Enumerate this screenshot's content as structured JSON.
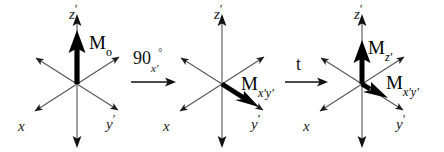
{
  "figure": {
    "stroke_color": "#1a1a1a",
    "vector_color": "#000000",
    "background": "#ffffff",
    "width": 444,
    "height": 152
  },
  "panels": [
    {
      "id": "panel-initial",
      "center": {
        "x": 77,
        "y": 84
      },
      "axes": [
        {
          "name": "z-prime",
          "label": "z",
          "prime": "′",
          "label_pos": {
            "x": 69,
            "y": 2
          }
        },
        {
          "name": "x-axis",
          "label": "x",
          "prime": "",
          "label_pos": {
            "x": 18,
            "y": 114
          }
        },
        {
          "name": "y-prime",
          "label": "y",
          "prime": "′",
          "label_pos": {
            "x": 106,
            "y": 112
          }
        }
      ],
      "vectors": [
        {
          "name": "M-zero",
          "label_main": "M",
          "label_sub": "o",
          "sub_italic": false,
          "label_pos": {
            "x": 89,
            "y": 33
          },
          "direction": "up-along-z-prime"
        }
      ]
    },
    {
      "id": "panel-after-pulse",
      "center": {
        "x": 222,
        "y": 84
      },
      "axes": [
        {
          "name": "z-prime",
          "label": "z",
          "prime": "′",
          "label_pos": {
            "x": 214,
            "y": 2
          }
        },
        {
          "name": "x-axis",
          "label": "x",
          "prime": "",
          "label_pos": {
            "x": 163,
            "y": 114
          }
        },
        {
          "name": "y-prime",
          "label": "y",
          "prime": "′",
          "label_pos": {
            "x": 251,
            "y": 112
          }
        }
      ],
      "vectors": [
        {
          "name": "M-xy-prime",
          "label_main": "M",
          "label_sub": "x′y′",
          "sub_italic": true,
          "label_pos": {
            "x": 241,
            "y": 74
          },
          "direction": "along-y-prime"
        }
      ]
    },
    {
      "id": "panel-after-relaxation",
      "center": {
        "x": 362,
        "y": 84
      },
      "axes": [
        {
          "name": "z-prime",
          "label": "z",
          "prime": "′",
          "label_pos": {
            "x": 354,
            "y": 2
          }
        },
        {
          "name": "x-axis",
          "label": "x",
          "prime": "",
          "label_pos": {
            "x": 303,
            "y": 114
          }
        },
        {
          "name": "y-prime",
          "label": "y",
          "prime": "′",
          "label_pos": {
            "x": 396,
            "y": 112
          }
        }
      ],
      "vectors": [
        {
          "name": "M-z-prime",
          "label_main": "M",
          "label_sub": "z′",
          "sub_italic": true,
          "label_pos": {
            "x": 368,
            "y": 38
          },
          "direction": "up-along-z-prime"
        },
        {
          "name": "M-xy-prime",
          "label_main": "M",
          "label_sub": "x′y′",
          "sub_italic": true,
          "label_pos": {
            "x": 386,
            "y": 73
          },
          "direction": "along-y-prime"
        }
      ]
    }
  ],
  "transitions": [
    {
      "id": "transition-pulse",
      "name": "ninety-degree-pulse",
      "label_main": "90",
      "label_sub": "x′",
      "label_deg": "°",
      "label_pos": {
        "x": 133,
        "y": 48
      },
      "arrow": {
        "x": 131,
        "y": 82,
        "length": 44
      }
    },
    {
      "id": "transition-time",
      "name": "evolution-time",
      "label_main": "t",
      "label_sub": "",
      "label_deg": "",
      "label_pos": {
        "x": 296,
        "y": 54
      },
      "arrow": {
        "x": 285,
        "y": 82,
        "length": 44
      }
    }
  ]
}
